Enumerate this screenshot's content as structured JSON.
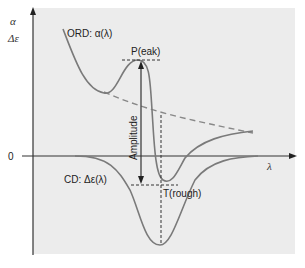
{
  "diagram": {
    "axes": {
      "y_label_top": "α",
      "y_label_bottom": "Δε",
      "zero_label": "0",
      "x_label": "λ"
    },
    "curves": {
      "ord_label": "ORD: α(λ)",
      "cd_label": "CD: Δε(λ)"
    },
    "annotations": {
      "peak": "P(eak)",
      "trough": "T(rough)",
      "amplitude": "Amplitude"
    },
    "colors": {
      "background_panel": "#ececec",
      "curve": "#7a7a7a",
      "axis": "#333333",
      "dashed": "#7a7a7a"
    }
  }
}
